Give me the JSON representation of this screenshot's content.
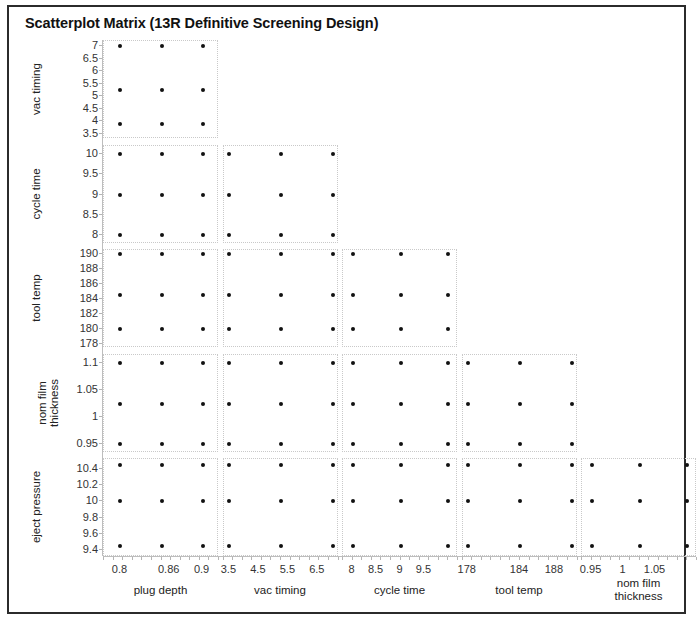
{
  "window": {
    "title": "Scatterplot Matrix (13R Definitive Screening Design)"
  },
  "chart_data": {
    "type": "scatter",
    "title": "Scatterplot Matrix (13R Definitive Screening Design)",
    "subtitle": "",
    "layout": "lower-triangular scatterplot matrix",
    "grid": true,
    "legend": null,
    "variables": [
      "plug depth",
      "vac timing",
      "cycle time",
      "tool temp",
      "nom film thickness",
      "eject pressure"
    ],
    "row_variables": [
      "vac timing",
      "cycle time",
      "tool temp",
      "nom film thickness",
      "eject pressure"
    ],
    "column_variables": [
      "plug depth",
      "vac timing",
      "cycle time",
      "tool temp",
      "nom film thickness"
    ],
    "row_axes": [
      {
        "name": "vac timing",
        "ticks": [
          7,
          6.5,
          6,
          5.5,
          5,
          4.5,
          4,
          3.5
        ],
        "tick_labels": [
          "7",
          "6.5",
          "6",
          "5.5",
          "5",
          "4.5",
          "4",
          "3.5"
        ],
        "ylim": [
          3.3,
          7.2
        ]
      },
      {
        "name": "cycle time",
        "ticks": [
          10,
          9.5,
          9,
          8.5,
          8
        ],
        "tick_labels": [
          "10",
          "9.5",
          "9",
          "8.5",
          "8"
        ],
        "ylim": [
          7.8,
          10.2
        ]
      },
      {
        "name": "tool temp",
        "ticks": [
          190,
          188,
          186,
          184,
          182,
          180,
          178
        ],
        "tick_labels": [
          "190",
          "188",
          "186",
          "184",
          "182",
          "180",
          "178"
        ],
        "ylim": [
          177.4,
          190.6
        ]
      },
      {
        "name": "nom film thickness",
        "ticks": [
          1.1,
          1.05,
          1,
          0.95
        ],
        "tick_labels": [
          "1.1",
          "1.05",
          "1",
          "0.95"
        ],
        "ylim": [
          0.935,
          1.115
        ]
      },
      {
        "name": "eject pressure",
        "ticks": [
          10.4,
          10.2,
          10,
          9.8,
          9.6,
          9.4
        ],
        "tick_labels": [
          "10.4",
          "10.2",
          "10",
          "9.8",
          "9.6",
          "9.4"
        ],
        "ylim": [
          9.32,
          10.52
        ]
      }
    ],
    "column_axes": [
      {
        "name": "plug depth",
        "ticks": [
          0.8,
          0.86,
          0.9
        ],
        "tick_labels": [
          "0.8",
          "0.86",
          "0.9"
        ],
        "xlim": [
          0.78,
          0.92
        ]
      },
      {
        "name": "vac timing",
        "ticks": [
          3.5,
          4.5,
          5.5,
          6.5
        ],
        "tick_labels": [
          "3.5",
          "4.5",
          "5.5",
          "6.5"
        ],
        "xlim": [
          3.3,
          7.2
        ]
      },
      {
        "name": "cycle time",
        "ticks": [
          8,
          8.5,
          9,
          9.5
        ],
        "tick_labels": [
          "8",
          "8.5",
          "9",
          "9.5"
        ],
        "xlim": [
          7.8,
          10.2
        ]
      },
      {
        "name": "tool temp",
        "ticks": [
          178,
          184,
          188
        ],
        "tick_labels": [
          "178",
          "184",
          "188"
        ],
        "xlim": [
          177.4,
          190.6
        ]
      },
      {
        "name": "nom film thickness",
        "ticks": [
          0.95,
          1,
          1.05
        ],
        "tick_labels": [
          "0.95",
          "1",
          "1.05"
        ],
        "xlim": [
          0.935,
          1.115
        ]
      }
    ],
    "factor_levels": {
      "plug depth": [
        0.8,
        0.85,
        0.9
      ],
      "vac timing": [
        3.5,
        5.25,
        7.0
      ],
      "cycle time": [
        8,
        9,
        10
      ],
      "tool temp": [
        178,
        184,
        190
      ],
      "nom film thickness": [
        0.95,
        1.025,
        1.1
      ],
      "eject pressure": [
        9.4,
        10.0,
        10.5
      ]
    },
    "panels": [
      {
        "row": "vac timing",
        "col": "plug depth",
        "x": [
          0.8,
          0.85,
          0.9,
          0.8,
          0.85,
          0.9,
          0.8,
          0.85,
          0.9
        ],
        "y": [
          7.0,
          7.0,
          7.0,
          5.25,
          5.25,
          5.25,
          3.9,
          3.9,
          3.9
        ]
      },
      {
        "row": "cycle time",
        "col": "plug depth",
        "x": [
          0.8,
          0.85,
          0.9,
          0.8,
          0.85,
          0.9,
          0.8,
          0.85,
          0.9
        ],
        "y": [
          10.0,
          10.0,
          10.0,
          9.0,
          9.0,
          9.0,
          8.0,
          8.0,
          8.0
        ]
      },
      {
        "row": "cycle time",
        "col": "vac timing",
        "x": [
          3.5,
          5.25,
          7.0,
          3.5,
          5.25,
          7.0,
          3.5,
          5.25,
          7.0
        ],
        "y": [
          10.0,
          10.0,
          10.0,
          9.0,
          9.0,
          9.0,
          8.0,
          8.0,
          8.0
        ]
      },
      {
        "row": "tool temp",
        "col": "plug depth",
        "x": [
          0.8,
          0.85,
          0.9,
          0.8,
          0.85,
          0.9,
          0.8,
          0.85,
          0.9
        ],
        "y": [
          190,
          190,
          190,
          184.5,
          184.5,
          184.5,
          180,
          180,
          180
        ]
      },
      {
        "row": "tool temp",
        "col": "vac timing",
        "x": [
          3.5,
          5.25,
          7.0,
          3.5,
          5.25,
          7.0,
          3.5,
          5.25,
          7.0
        ],
        "y": [
          190,
          190,
          190,
          184.5,
          184.5,
          184.5,
          180,
          180,
          180
        ]
      },
      {
        "row": "tool temp",
        "col": "cycle time",
        "x": [
          8,
          9,
          10,
          8,
          9,
          10,
          8,
          9,
          10
        ],
        "y": [
          190,
          190,
          190,
          184.5,
          184.5,
          184.5,
          180,
          180,
          180
        ]
      },
      {
        "row": "nom film thickness",
        "col": "plug depth",
        "x": [
          0.8,
          0.85,
          0.9,
          0.8,
          0.85,
          0.9,
          0.8,
          0.85,
          0.9
        ],
        "y": [
          1.1,
          1.1,
          1.1,
          1.025,
          1.025,
          1.025,
          0.95,
          0.95,
          0.95
        ]
      },
      {
        "row": "nom film thickness",
        "col": "vac timing",
        "x": [
          3.5,
          5.25,
          7.0,
          3.5,
          5.25,
          7.0,
          3.5,
          5.25,
          7.0
        ],
        "y": [
          1.1,
          1.1,
          1.1,
          1.025,
          1.025,
          1.025,
          0.95,
          0.95,
          0.95
        ]
      },
      {
        "row": "nom film thickness",
        "col": "cycle time",
        "x": [
          8,
          9,
          10,
          8,
          9,
          10,
          8,
          9,
          10
        ],
        "y": [
          1.1,
          1.1,
          1.1,
          1.025,
          1.025,
          1.025,
          0.95,
          0.95,
          0.95
        ]
      },
      {
        "row": "nom film thickness",
        "col": "tool temp",
        "x": [
          178,
          184,
          190,
          178,
          184,
          190,
          178,
          184,
          190
        ],
        "y": [
          1.1,
          1.1,
          1.1,
          1.025,
          1.025,
          1.025,
          0.95,
          0.95,
          0.95
        ]
      },
      {
        "row": "eject pressure",
        "col": "plug depth",
        "x": [
          0.8,
          0.85,
          0.9,
          0.8,
          0.85,
          0.9,
          0.8,
          0.85,
          0.9
        ],
        "y": [
          10.45,
          10.45,
          10.45,
          10.0,
          10.0,
          10.0,
          9.45,
          9.45,
          9.45
        ]
      },
      {
        "row": "eject pressure",
        "col": "vac timing",
        "x": [
          3.5,
          5.25,
          7.0,
          3.5,
          5.25,
          7.0,
          3.5,
          5.25,
          7.0
        ],
        "y": [
          10.45,
          10.45,
          10.45,
          10.0,
          10.0,
          10.0,
          9.45,
          9.45,
          9.45
        ]
      },
      {
        "row": "eject pressure",
        "col": "cycle time",
        "x": [
          8,
          9,
          10,
          8,
          9,
          10,
          8,
          9,
          10
        ],
        "y": [
          10.45,
          10.45,
          10.45,
          10.0,
          10.0,
          10.0,
          9.45,
          9.45,
          9.45
        ]
      },
      {
        "row": "eject pressure",
        "col": "tool temp",
        "x": [
          178,
          184,
          190,
          178,
          184,
          190,
          178,
          184,
          190
        ],
        "y": [
          10.45,
          10.45,
          10.45,
          10.0,
          10.0,
          10.0,
          9.45,
          9.45,
          9.45
        ]
      },
      {
        "row": "eject pressure",
        "col": "nom film thickness",
        "x": [
          0.95,
          1.025,
          1.1,
          0.95,
          1.025,
          1.1,
          0.95,
          1.025,
          1.1
        ],
        "y": [
          10.45,
          10.45,
          10.45,
          10.0,
          10.0,
          10.0,
          9.45,
          9.45,
          9.45
        ]
      }
    ]
  }
}
